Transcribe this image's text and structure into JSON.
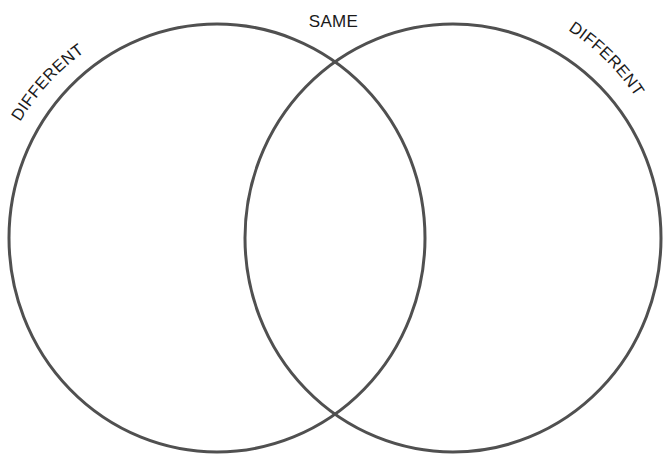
{
  "diagram": {
    "type": "venn",
    "background": "#ffffff",
    "stroke_color": "#4f4f4f",
    "labels": {
      "left": "DIFFERENT",
      "center": "SAME",
      "right": "DIFFERENT"
    },
    "circles": [
      {
        "name": "left",
        "cx": 217,
        "cy": 238,
        "rx": 208,
        "ry": 214
      },
      {
        "name": "right",
        "cx": 453,
        "cy": 238,
        "rx": 208,
        "ry": 214
      }
    ]
  }
}
